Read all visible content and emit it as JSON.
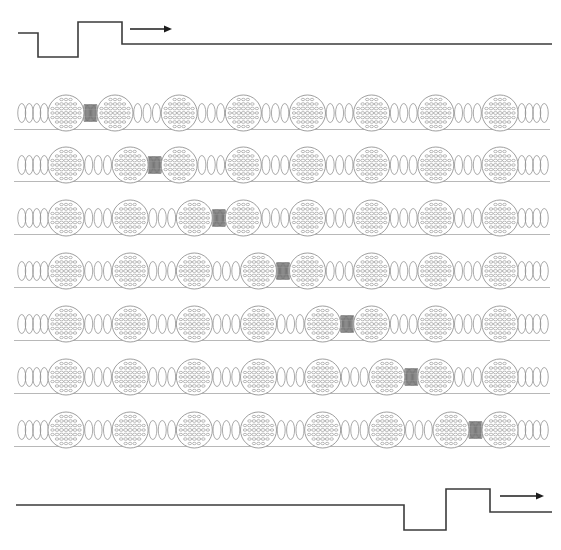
{
  "figure": {
    "caption": "",
    "width": 561,
    "height": 550,
    "background_color": "#ffffff"
  },
  "colors": {
    "trace": "#3b3b3b",
    "arrow": "#1d1d1d",
    "spring": "#8d8d8d",
    "spring_compressed": "#6f6f6f",
    "sphere_outline": "#8d8d8d",
    "sphere_dimple": "#9b9b9b",
    "baseline": "#9a9a9a"
  },
  "chart_data": {
    "type": "line",
    "xlabel": "",
    "ylabel": "",
    "grid": false,
    "legend": "none",
    "xlim": [
      0,
      561
    ],
    "ylim": [
      0,
      550
    ],
    "series": [
      {
        "name": "pulse-waveform-top",
        "description": "Square displacement pulse at left end, time t = 0",
        "points": [
          [
            18,
            33
          ],
          [
            38,
            33
          ],
          [
            38,
            57
          ],
          [
            78,
            57
          ],
          [
            78,
            22
          ],
          [
            122,
            22
          ],
          [
            122,
            44
          ],
          [
            552,
            44
          ]
        ]
      },
      {
        "name": "pulse-waveform-bottom",
        "description": "Same square displacement pulse shifted to right end, later time",
        "points": [
          [
            16,
            505
          ],
          [
            404,
            505
          ],
          [
            404,
            530
          ],
          [
            446,
            530
          ],
          [
            446,
            489
          ],
          [
            490,
            489
          ],
          [
            490,
            512
          ],
          [
            552,
            512
          ]
        ]
      }
    ],
    "annotations": [
      {
        "name": "direction-arrow-top",
        "x1": 130,
        "y1": 29,
        "x2": 172,
        "y2": 29,
        "label": "",
        "direction": "right"
      },
      {
        "name": "direction-arrow-bottom",
        "x1": 500,
        "y1": 496,
        "x2": 544,
        "y2": 496,
        "label": "",
        "direction": "right"
      }
    ]
  },
  "chain": {
    "sphere_count_per_row": 8,
    "spring_count_per_row": 9,
    "row_count": 7,
    "row_y_centers": [
      113,
      165,
      218,
      271,
      324,
      377,
      430
    ],
    "sphere_radius": 18,
    "chain_left": 18,
    "chain_right": 548,
    "compressed_gap_index_by_row": [
      1,
      2,
      3,
      4,
      5,
      6,
      7
    ],
    "rows": [
      {
        "index": 1,
        "label": "row-1",
        "compressed_spring_between": [
          1,
          2
        ]
      },
      {
        "index": 2,
        "label": "row-2",
        "compressed_spring_between": [
          2,
          3
        ]
      },
      {
        "index": 3,
        "label": "row-3",
        "compressed_spring_between": [
          3,
          4
        ]
      },
      {
        "index": 4,
        "label": "row-4",
        "compressed_spring_between": [
          4,
          5
        ]
      },
      {
        "index": 5,
        "label": "row-5",
        "compressed_spring_between": [
          5,
          6
        ]
      },
      {
        "index": 6,
        "label": "row-6",
        "compressed_spring_between": [
          6,
          7
        ]
      },
      {
        "index": 7,
        "label": "row-7",
        "compressed_spring_between": [
          7,
          8
        ]
      }
    ]
  },
  "sphere_texture": {
    "style": "dimpled",
    "dimple_rows": 7,
    "dimple_cols": 7,
    "dimple_rx": 2.1,
    "dimple_ry": 1.45
  },
  "spring_style": {
    "relaxed_loops": 6,
    "relaxed_loop_rx": 4.0,
    "compressed_loops": 11,
    "compressed_loop_rx": 1.15,
    "coil_ry": 9.5
  }
}
